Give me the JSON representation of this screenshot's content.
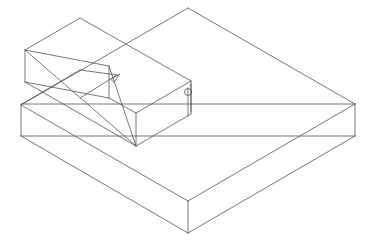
{
  "diagram": {
    "type": "isometric-wireframe",
    "stroke_color": "#555555",
    "background": "#ffffff",
    "stroke_width": 0.8
  }
}
